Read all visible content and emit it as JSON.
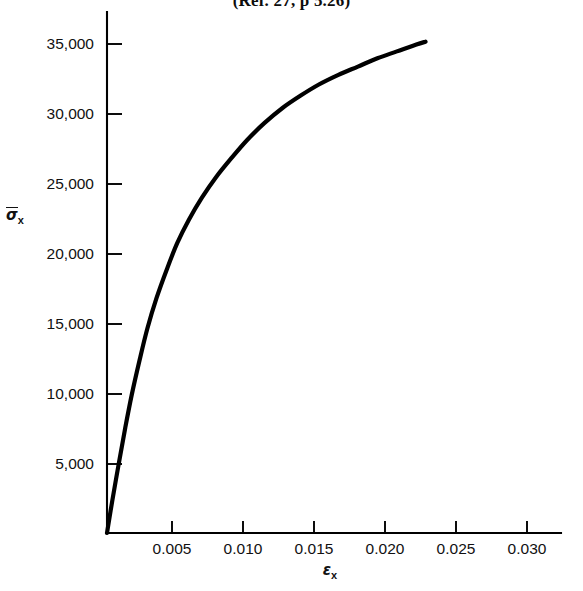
{
  "figure": {
    "title": "(Ref. 27, p 5.26)",
    "background_color": "#ffffff",
    "curve_color": "#000000",
    "axis_color": "#000000"
  },
  "axes": {
    "y_label_symbol": "σ",
    "y_label_subscript": "x",
    "x_label_symbol": "ε",
    "x_label_subscript": "x",
    "y_ticks": [
      {
        "value": 5000,
        "label": "5,000"
      },
      {
        "value": 10000,
        "label": "10,000"
      },
      {
        "value": 15000,
        "label": "15,000"
      },
      {
        "value": 20000,
        "label": "20,000"
      },
      {
        "value": 25000,
        "label": "25,000"
      },
      {
        "value": 30000,
        "label": "30,000"
      },
      {
        "value": 35000,
        "label": "35,000"
      }
    ],
    "x_ticks": [
      {
        "value": 0.005,
        "label": "0.005"
      },
      {
        "value": 0.01,
        "label": "0.010"
      },
      {
        "value": 0.015,
        "label": "0.015"
      },
      {
        "value": 0.02,
        "label": "0.020"
      },
      {
        "value": 0.025,
        "label": "0.025"
      },
      {
        "value": 0.03,
        "label": "0.030"
      }
    ]
  },
  "chart_data": {
    "type": "line",
    "title": "(Ref. 27, p 5.26)",
    "xlabel": "εx",
    "ylabel": "σ̄x",
    "xlim": [
      0.0,
      0.0325
    ],
    "ylim": [
      0,
      37500
    ],
    "grid": false,
    "legend": null,
    "series": [
      {
        "name": "stress-strain",
        "x": [
          0.0,
          0.0004,
          0.0009,
          0.0014,
          0.0019,
          0.0025,
          0.0031,
          0.0038,
          0.0046,
          0.0054,
          0.0063,
          0.0073,
          0.0084,
          0.0096,
          0.0108,
          0.0121,
          0.0135,
          0.0149,
          0.0163,
          0.0178,
          0.0193,
          0.0208,
          0.0223,
          0.0238,
          0.0245
        ],
        "y": [
          0,
          2300,
          5000,
          7600,
          10000,
          12500,
          14800,
          17000,
          19100,
          21000,
          22700,
          24300,
          25800,
          27200,
          28500,
          29700,
          30800,
          31700,
          32500,
          33200,
          33800,
          34400,
          34900,
          35400,
          35600
        ]
      }
    ]
  }
}
